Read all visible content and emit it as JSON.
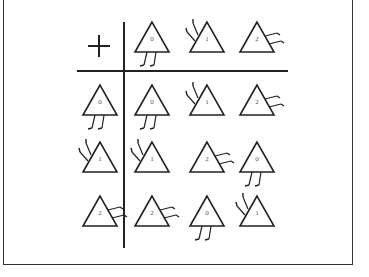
{
  "table": {
    "operator": "+",
    "description": "Addition table of triangles (mod 3)",
    "column_headers": [
      "0",
      "1",
      "2"
    ],
    "row_headers": [
      "0",
      "1",
      "2"
    ],
    "cells": [
      [
        "0",
        "1",
        "2"
      ],
      [
        "1",
        "2",
        "0"
      ],
      [
        "2",
        "0",
        "1"
      ]
    ],
    "leg_styles": {
      "0": "legs-down",
      "1": "legs-up-left",
      "2": "legs-right"
    },
    "colors": {
      "stroke": "#222222",
      "background": "#ffffff",
      "label": "#555555"
    }
  }
}
